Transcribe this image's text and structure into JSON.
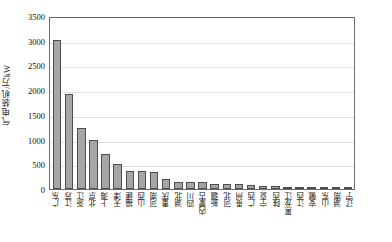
{
  "chart_data": {
    "type": "bar",
    "title": "",
    "xlabel": "",
    "ylabel": "气电装机/万kW",
    "ylim": [
      0,
      3500
    ],
    "ytick_values": [
      0,
      500,
      1000,
      1500,
      2000,
      2500,
      3000,
      3500
    ],
    "ytick_labels": [
      "0",
      "500",
      "1000",
      "1500",
      "2000",
      "2500",
      "3000",
      "3500"
    ],
    "grid": true,
    "legend": "none",
    "bar_color": "#a6a6a6",
    "bar_edge_color": "#4d4d4d",
    "categories": [
      "广东",
      "江苏",
      "浙江",
      "北京",
      "上海",
      "天津",
      "福建",
      "山西",
      "河南",
      "重庆",
      "湖北",
      "四川",
      "内蒙古",
      "新疆",
      "河北",
      "贵州",
      "广西",
      "宁夏",
      "陕西",
      "黑龙江",
      "江西",
      "安徽",
      "山东",
      "湖南",
      "辽宁"
    ],
    "values": [
      3060,
      1940,
      1250,
      1010,
      720,
      520,
      370,
      360,
      355,
      200,
      150,
      145,
      135,
      105,
      100,
      95,
      85,
      70,
      58,
      45,
      32,
      22,
      18,
      12,
      8
    ]
  }
}
